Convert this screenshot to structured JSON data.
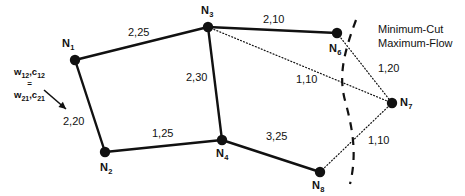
{
  "figure": {
    "background": "#ffffff",
    "ink": "#111111"
  },
  "chart_data": {
    "type": "diagram",
    "subtype": "node-link-graph",
    "title": "",
    "nodes": [
      {
        "id": "N1",
        "label": "N",
        "sub": "1",
        "x": 75,
        "y": 60,
        "label_dx": -13,
        "label_dy": -22
      },
      {
        "id": "N2",
        "label": "N",
        "sub": "2",
        "x": 105,
        "y": 152,
        "label_dx": -5,
        "label_dy": 10
      },
      {
        "id": "N3",
        "label": "N",
        "sub": "3",
        "x": 208,
        "y": 27,
        "label_dx": -7,
        "label_dy": -22
      },
      {
        "id": "N4",
        "label": "N",
        "sub": "4",
        "x": 222,
        "y": 140,
        "label_dx": -6,
        "label_dy": 8
      },
      {
        "id": "N6",
        "label": "N",
        "sub": "6",
        "x": 337,
        "y": 33,
        "label_dx": -8,
        "label_dy": 10
      },
      {
        "id": "N7",
        "label": "N",
        "sub": "7",
        "x": 392,
        "y": 103,
        "label_dx": 8,
        "label_dy": -6
      },
      {
        "id": "N8",
        "label": "N",
        "sub": "8",
        "x": 320,
        "y": 172,
        "label_dx": -8,
        "label_dy": 8
      }
    ],
    "edges": [
      {
        "from": "N1",
        "to": "N3",
        "style": "solid",
        "label": "2,25",
        "label_x": 128,
        "label_y": 27
      },
      {
        "from": "N1",
        "to": "N2",
        "style": "solid",
        "label": "2,20",
        "label_x": 63,
        "label_y": 116
      },
      {
        "from": "N2",
        "to": "N4",
        "style": "solid",
        "label": "1,25",
        "label_x": 152,
        "label_y": 128
      },
      {
        "from": "N3",
        "to": "N4",
        "style": "solid",
        "label": "2,30",
        "label_x": 186,
        "label_y": 72
      },
      {
        "from": "N3",
        "to": "N6",
        "style": "solid",
        "label": "2,10",
        "label_x": 263,
        "label_y": 14
      },
      {
        "from": "N3",
        "to": "N7",
        "style": "dotted",
        "label": "1,10",
        "label_x": 296,
        "label_y": 74
      },
      {
        "from": "N4",
        "to": "N8",
        "style": "solid",
        "label": "3,25",
        "label_x": 266,
        "label_y": 131
      },
      {
        "from": "N6",
        "to": "N7",
        "style": "dotted",
        "label": "1,20",
        "label_x": 378,
        "label_y": 63
      },
      {
        "from": "N8",
        "to": "N7",
        "style": "dotted",
        "label": "1,10",
        "label_x": 368,
        "label_y": 135
      }
    ],
    "cut": {
      "style": "dashed",
      "label_line1": "Minimum-Cut",
      "label_line2": "Maximum-Flow",
      "label_x": 378,
      "label_y": 23,
      "path": "M 356 20 C 343 55, 338 78, 346 104 C 353 131, 357 155, 350 184"
    },
    "annotation": {
      "line1_pre": "w",
      "line1_sub1": "12",
      "line1_mid": ",c",
      "line1_sub2": "12",
      "equals": "=",
      "line2_pre": "w",
      "line2_sub1": "21",
      "line2_mid": ",c",
      "line2_sub2": "21",
      "x": 14,
      "y": 66,
      "arrow": {
        "x1": 44,
        "y1": 90,
        "x2": 66,
        "y2": 109
      }
    }
  }
}
